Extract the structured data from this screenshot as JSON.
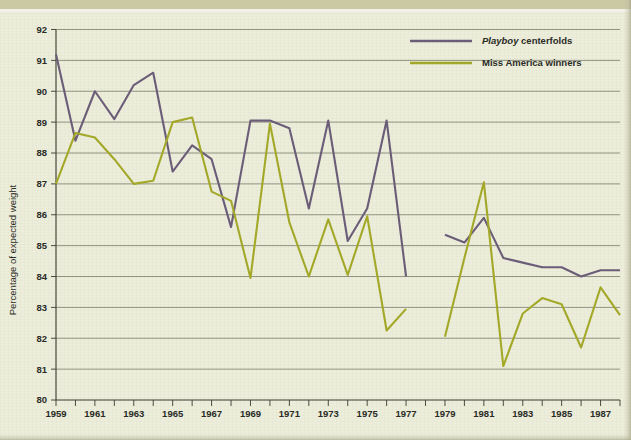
{
  "figure": {
    "background_color": "#eceedb",
    "band_color": "#cbc9a4",
    "axis_title_y": "Percentage of expected weight"
  },
  "legend": {
    "position": "top-right",
    "entries": [
      {
        "label_italic": "Playboy",
        "label_rest": " centerfolds",
        "color": "#6b5d78",
        "name": "playboy-centerfolds"
      },
      {
        "label_italic": "",
        "label_rest": "Miss America winners",
        "color": "#a3a828",
        "name": "miss-america-winners"
      }
    ]
  },
  "chart_data": {
    "type": "line",
    "title": "",
    "xlabel": "",
    "ylabel": "Percentage of expected weight",
    "xlim": [
      1959,
      1988
    ],
    "ylim": [
      80,
      92
    ],
    "grid": true,
    "legend_position": "top-right",
    "x": [
      1959,
      1960,
      1961,
      1962,
      1963,
      1964,
      1965,
      1966,
      1967,
      1968,
      1969,
      1970,
      1971,
      1972,
      1973,
      1974,
      1975,
      1976,
      1977,
      1978,
      1979,
      1980,
      1981,
      1982,
      1983,
      1984,
      1985,
      1986,
      1987,
      1988
    ],
    "ytick_labels": [
      "80",
      "81",
      "82",
      "83",
      "84",
      "85",
      "86",
      "87",
      "88",
      "89",
      "90",
      "91",
      "92"
    ],
    "xtick_labels": [
      "1959",
      "1961",
      "1963",
      "1965",
      "1967",
      "1969",
      "1971",
      "1973",
      "1975",
      "1977",
      "1979",
      "1981",
      "1983",
      "1985",
      "1987"
    ],
    "series": [
      {
        "name": "Playboy centerfolds",
        "color": "#6b5d78",
        "x": [
          1959,
          1960,
          1961,
          1962,
          1963,
          1964,
          1965,
          1966,
          1967,
          1968,
          1969,
          1970,
          1971,
          1972,
          1973,
          1974,
          1975,
          1976,
          1977,
          1978
        ],
        "values": [
          91.2,
          88.4,
          90.0,
          89.1,
          90.2,
          90.6,
          87.4,
          88.25,
          87.8,
          85.6,
          89.05,
          89.05,
          88.8,
          86.2,
          89.05,
          85.15,
          86.2,
          89.05,
          84.0,
          null
        ],
        "x2": [
          1979,
          1980,
          1981,
          1982,
          1983,
          1984,
          1985,
          1986,
          1987,
          1988
        ],
        "values2": [
          85.35,
          85.1,
          85.9,
          84.6,
          84.45,
          84.3,
          84.3,
          84.0,
          84.2,
          84.2
        ]
      },
      {
        "name": "Miss America winners",
        "color": "#a3a828",
        "x": [
          1959,
          1960,
          1961,
          1962,
          1963,
          1964,
          1965,
          1966,
          1967,
          1968,
          1969,
          1970,
          1971,
          1972,
          1973,
          1974,
          1975,
          1976,
          1977,
          1978
        ],
        "values": [
          87.0,
          88.65,
          88.5,
          87.8,
          87.0,
          87.1,
          89.0,
          89.15,
          86.75,
          86.45,
          83.95,
          88.95,
          85.75,
          84.0,
          85.85,
          84.05,
          85.95,
          82.25,
          82.95,
          null
        ],
        "x2": [
          1979,
          1980,
          1981,
          1982,
          1983,
          1984,
          1985,
          1986,
          1987,
          1988
        ],
        "values2": [
          82.05,
          84.6,
          87.05,
          81.1,
          82.8,
          83.3,
          83.1,
          81.7,
          83.65,
          82.75
        ]
      }
    ]
  }
}
